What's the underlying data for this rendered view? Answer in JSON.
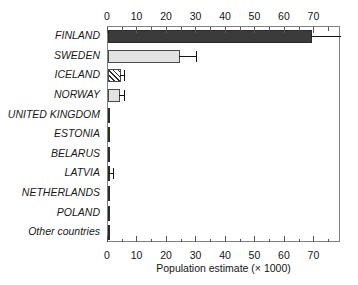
{
  "chart_data": {
    "type": "bar",
    "orientation": "horizontal",
    "title": "",
    "xlabel": "Population estimate (× 1000)",
    "ylabel": "",
    "xlim": [
      0,
      79
    ],
    "grid": false,
    "legend": null,
    "xticks": [
      0,
      10,
      20,
      30,
      40,
      50,
      60,
      70
    ],
    "xticklabels": [
      "0",
      "10",
      "20",
      "30",
      "40",
      "50",
      "60",
      "70"
    ],
    "minor_tick_interval": 5,
    "axis_top": true,
    "axis_bottom": true,
    "categories": [
      "FINLAND",
      "SWEDEN",
      "ICELAND",
      "NORWAY",
      "UNITED KINGDOM",
      "ESTONIA",
      "BELARUS",
      "LATVIA",
      "NETHERLANDS",
      "POLAND",
      "Other countries"
    ],
    "values": [
      69,
      24.5,
      4.3,
      4.0,
      0.5,
      0.2,
      0.2,
      0.15,
      0.15,
      0.15,
      0.15
    ],
    "errors_upper": [
      79,
      30,
      5.5,
      5.5,
      null,
      null,
      null,
      1.6,
      null,
      null,
      null
    ],
    "bar_styles": [
      "solid-dark",
      "light",
      "hatch",
      "light",
      "hairline",
      "hairline",
      "hairline",
      "hairline",
      "hairline",
      "hairline",
      "hairline"
    ],
    "colors": {
      "dark_fill": "#3b3b3b",
      "light_fill": "#e2e2e2",
      "hatch_fill": "#f2f2f2",
      "edge": "#4a4a4a",
      "error": "#141414",
      "frame": "#808080",
      "background": "#ffffff"
    }
  }
}
